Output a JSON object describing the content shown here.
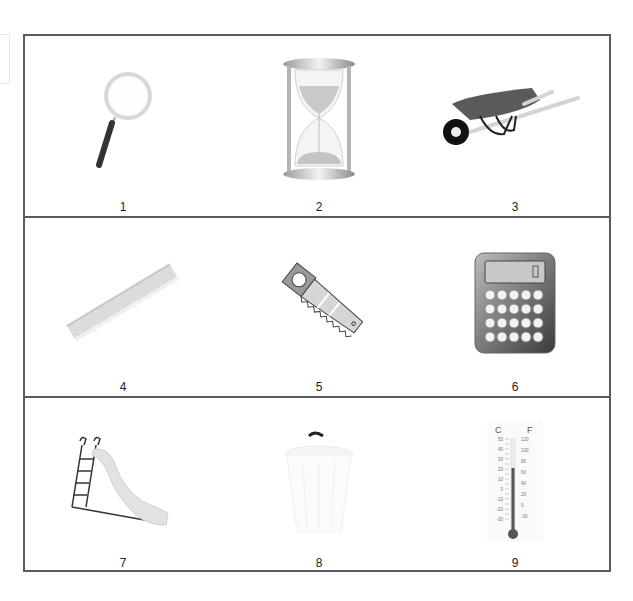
{
  "worksheet": {
    "items": [
      {
        "number": "1",
        "object": "magnifying glass",
        "icon": "magnifying-glass-icon"
      },
      {
        "number": "2",
        "object": "hourglass",
        "icon": "hourglass-icon"
      },
      {
        "number": "3",
        "object": "wheelbarrow",
        "icon": "wheelbarrow-icon"
      },
      {
        "number": "4",
        "object": "ruler",
        "icon": "ruler-icon"
      },
      {
        "number": "5",
        "object": "saw",
        "icon": "saw-icon"
      },
      {
        "number": "6",
        "object": "calculator",
        "icon": "calculator-icon"
      },
      {
        "number": "7",
        "object": "slide",
        "icon": "slide-icon"
      },
      {
        "number": "8",
        "object": "bucket",
        "icon": "bucket-icon"
      },
      {
        "number": "9",
        "object": "thermometer",
        "icon": "thermometer-icon"
      }
    ],
    "thermometer": {
      "unit_left": "C",
      "unit_right": "F",
      "celsius_ticks": [
        "50",
        "40",
        "30",
        "20",
        "10",
        "0",
        "-10",
        "-20",
        "-30"
      ],
      "fahrenheit_ticks": [
        "120",
        "100",
        "80",
        "60",
        "40",
        "20",
        "0",
        "-20"
      ]
    },
    "colors": {
      "border": "#5a5a5a",
      "text": "#222222"
    }
  }
}
